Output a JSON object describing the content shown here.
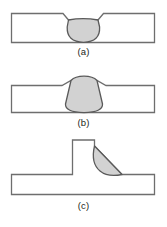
{
  "figure": {
    "type": "technical-diagram",
    "panel_count": 3,
    "colors": {
      "plate_outline": "#6e6e6e",
      "plate_fill": "#ffffff",
      "bead_outline": "#5a5a5a",
      "bead_fill": "#d2d2d2",
      "caption_text": "#231f20",
      "background": "#ffffff"
    },
    "panels": [
      {
        "id": "a",
        "caption": "(a)",
        "joint": "butt joint",
        "weld": "groove weld, flush / slightly concave bead",
        "plate": {
          "x": 11,
          "y": 13,
          "width": 144,
          "height": 30
        },
        "bead": {
          "top_left_x": 63,
          "top_right_x": 103,
          "top_y": 13,
          "bottom_y": 43,
          "profile": "U-shaped, contained within plate thickness"
        }
      },
      {
        "id": "b",
        "caption": "(b)",
        "joint": "butt joint",
        "weld": "groove weld, convex reinforcement above surface",
        "plate": {
          "x": 11,
          "y": 85,
          "width": 144,
          "height": 28
        },
        "bead": {
          "top_left_x": 62,
          "top_right_x": 106,
          "crown_y": 77,
          "bottom_y": 113,
          "profile": "rounded triangular crown protruding above plate"
        }
      },
      {
        "id": "c",
        "caption": "(c)",
        "joint": "tee joint",
        "weld": "fillet weld, convex teardrop bead",
        "horizontal_plate": {
          "x": 11,
          "y": 174,
          "width": 144,
          "height": 21
        },
        "vertical_plate": {
          "x": 72,
          "y": 140,
          "width": 23,
          "height": 34
        },
        "bead": {
          "apex_x": 95,
          "apex_y": 146,
          "toe_x": 122,
          "toe_y": 174,
          "profile": "teardrop / rounded right triangle in the corner"
        }
      }
    ]
  },
  "captions": {
    "a": "(a)",
    "b": "(b)",
    "c": "(c)"
  }
}
